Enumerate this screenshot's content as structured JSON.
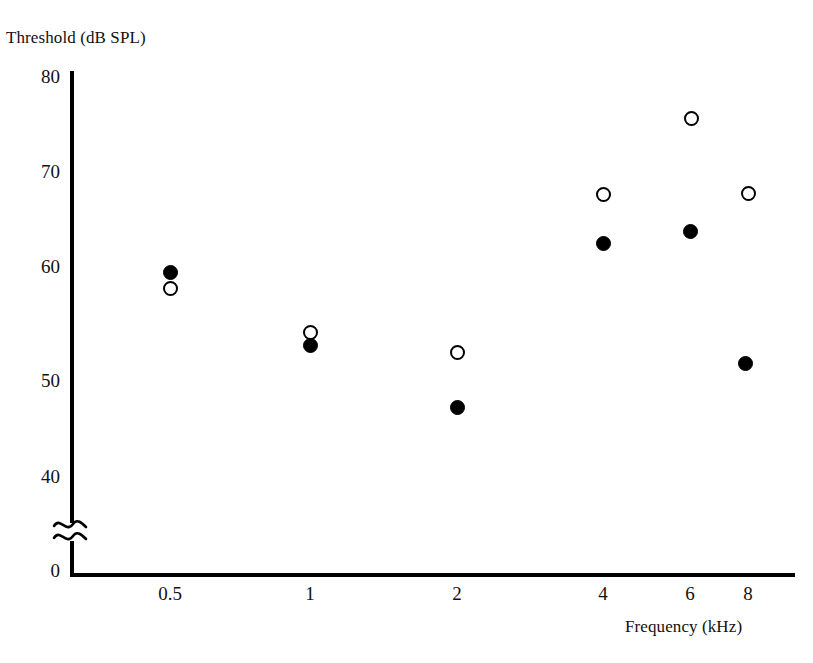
{
  "chart_data": {
    "type": "scatter",
    "title": "",
    "xlabel": "Frequency (kHz)",
    "ylabel": "Threshold (dB SPL)",
    "x": [
      0.5,
      1,
      2,
      4,
      6,
      8
    ],
    "xtick_labels": [
      "0.5",
      "1",
      "2",
      "4",
      "6",
      "8"
    ],
    "xscale": "log",
    "ytick_labels": [
      "80",
      "70",
      "60",
      "50",
      "40",
      "0"
    ],
    "ytick_values": [
      80,
      70,
      60,
      50,
      40,
      0
    ],
    "ylim": [
      40,
      80
    ],
    "y_axis_break": true,
    "y_axis_break_note": "axis broken between 40 and 0",
    "grid": false,
    "legend": "none",
    "series": [
      {
        "name": "filled-circle-series",
        "marker": "filled-circle",
        "values": [
          60.3,
          53.6,
          47.0,
          63.4,
          64.6,
          51.4
        ]
      },
      {
        "name": "open-circle-series",
        "marker": "open-circle",
        "values": [
          58.9,
          54.7,
          52.7,
          68.0,
          75.8,
          68.2
        ]
      }
    ]
  },
  "axes": {
    "y_ticks": [
      {
        "label": "80",
        "top": 66
      },
      {
        "label": "70",
        "top": 161
      },
      {
        "label": "60",
        "top": 256
      },
      {
        "label": "50",
        "top": 370
      },
      {
        "label": "40",
        "top": 466
      },
      {
        "label": "0",
        "top": 560
      }
    ],
    "x_ticks": [
      {
        "label": "0.5",
        "left": 140
      },
      {
        "label": "1",
        "left": 280
      },
      {
        "label": "2",
        "left": 427
      },
      {
        "label": "4",
        "left": 573
      },
      {
        "label": "6",
        "left": 660
      },
      {
        "label": "8",
        "left": 718
      }
    ]
  },
  "markers": {
    "filled": [
      {
        "left": 163,
        "top": 265
      },
      {
        "left": 303,
        "top": 338
      },
      {
        "left": 450,
        "top": 400
      },
      {
        "left": 596,
        "top": 236
      },
      {
        "left": 683,
        "top": 224
      },
      {
        "left": 738,
        "top": 356
      }
    ],
    "open": [
      {
        "left": 163,
        "top": 281
      },
      {
        "left": 303,
        "top": 325
      },
      {
        "left": 450,
        "top": 345
      },
      {
        "left": 596,
        "top": 187
      },
      {
        "left": 684,
        "top": 111
      },
      {
        "left": 741,
        "top": 186
      }
    ]
  },
  "colors": {
    "ink": "#000000",
    "background": "#ffffff"
  }
}
